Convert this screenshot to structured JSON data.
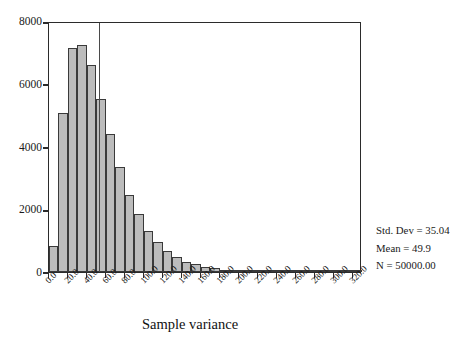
{
  "chart_data": {
    "type": "bar",
    "title": "",
    "xlabel": "Sample variance",
    "ylabel": "",
    "xlim": [
      0,
      330
    ],
    "ylim": [
      0,
      8000
    ],
    "grid": false,
    "legend": null,
    "bin_width": 10,
    "x_tick_labels": [
      "0.0",
      "20.0",
      "40.0",
      "60.0",
      "80.0",
      "100.0",
      "120.0",
      "140.0",
      "160.0",
      "180.0",
      "200.0",
      "220.0",
      "240.0",
      "260.0",
      "280.0",
      "300.0",
      "320.0"
    ],
    "x_tick_values": [
      0,
      20,
      40,
      60,
      80,
      100,
      120,
      140,
      160,
      180,
      200,
      220,
      240,
      260,
      280,
      300,
      320
    ],
    "y_tick_labels": [
      "0",
      "2000",
      "4000",
      "6000",
      "8000"
    ],
    "y_tick_values": [
      0,
      2000,
      4000,
      6000,
      8000
    ],
    "bin_starts": [
      0,
      10,
      20,
      30,
      40,
      50,
      60,
      70,
      80,
      90,
      100,
      110,
      120,
      130,
      140,
      150,
      160,
      170,
      180,
      190,
      200,
      210,
      220,
      230,
      240,
      250,
      260,
      270,
      280,
      290,
      300,
      310,
      320
    ],
    "values": [
      830,
      5070,
      7150,
      7250,
      6600,
      5500,
      4400,
      3350,
      2450,
      1850,
      1300,
      950,
      680,
      480,
      330,
      240,
      160,
      120,
      80,
      60,
      45,
      35,
      25,
      18,
      14,
      10,
      8,
      6,
      5,
      4,
      3,
      2,
      2
    ],
    "categories": [
      "0",
      "10",
      "20",
      "30",
      "40",
      "50",
      "60",
      "70",
      "80",
      "90",
      "100",
      "110",
      "120",
      "130",
      "140",
      "150",
      "160",
      "170",
      "180",
      "190",
      "200",
      "210",
      "220",
      "230",
      "240",
      "250",
      "260",
      "270",
      "280",
      "290",
      "300",
      "310",
      "320"
    ],
    "bar_fill_color": "#bcbcbc",
    "bar_edge_color": "#3a3a3a",
    "axis_color": "#2b2b2b",
    "annotations": [
      "Std. Dev = 35.04",
      "Mean = 49.9",
      "N = 50000.00"
    ]
  },
  "stats": {
    "std_dev": "Std. Dev = 35.04",
    "mean": "Mean = 49.9",
    "n": "N = 50000.00"
  }
}
